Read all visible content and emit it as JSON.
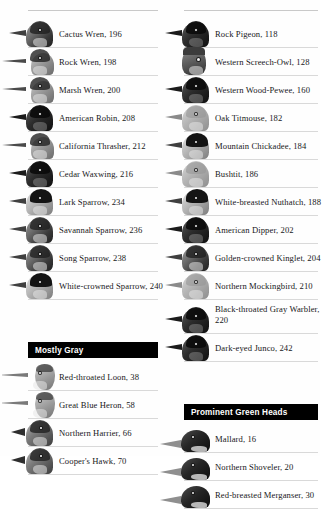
{
  "page": {
    "layout": "two-column-index",
    "background_color": "#fefefe",
    "text_color": "#18181a",
    "rule_color": "#d9d9d9",
    "header_bar_color": "#000000",
    "header_text_color": "#ffffff"
  },
  "left_column": {
    "blocks": [
      {
        "type": "list",
        "entries": [
          {
            "name": "Cactus Wren",
            "page": "196",
            "label": "Cactus Wren, 196",
            "thumb": "bird-head-cactus-wren",
            "variant": "default"
          },
          {
            "name": "Rock Wren",
            "page": "198",
            "label": "Rock Wren, 198",
            "thumb": "bird-head-rock-wren",
            "variant": "longbill"
          },
          {
            "name": "Marsh Wren",
            "page": "200",
            "label": "Marsh Wren, 200",
            "thumb": "bird-head-marsh-wren",
            "variant": "longbill"
          },
          {
            "name": "American Robin",
            "page": "208",
            "label": "American Robin, 208",
            "thumb": "bird-head-american-robin",
            "variant": "dark"
          },
          {
            "name": "California Thrasher",
            "page": "212",
            "label": "California Thrasher, 212",
            "thumb": "bird-head-california-thrasher",
            "variant": "longbill"
          },
          {
            "name": "Cedar Waxwing",
            "page": "216",
            "label": "Cedar Waxwing, 216",
            "thumb": "bird-head-cedar-waxwing",
            "variant": "dark"
          },
          {
            "name": "Lark Sparrow",
            "page": "234",
            "label": "Lark Sparrow, 234",
            "thumb": "bird-head-lark-sparrow",
            "variant": "capped"
          },
          {
            "name": "Savannah Sparrow",
            "page": "236",
            "label": "Savannah Sparrow, 236",
            "thumb": "bird-head-savannah-sparrow",
            "variant": "default"
          },
          {
            "name": "Song Sparrow",
            "page": "238",
            "label": "Song Sparrow, 238",
            "thumb": "bird-head-song-sparrow",
            "variant": "default"
          },
          {
            "name": "White-crowned Sparrow",
            "page": "240",
            "label": "White-crowned Sparrow, 240",
            "thumb": "bird-head-white-crowned-sparrow",
            "variant": "capped"
          }
        ]
      },
      {
        "type": "section",
        "header": "Mostly Gray",
        "entries": [
          {
            "name": "Red-throated Loon",
            "page": "38",
            "label": "Red-throated Loon, 38",
            "thumb": "bird-head-red-throated-loon",
            "variant": "heron"
          },
          {
            "name": "Great Blue Heron",
            "page": "58",
            "label": "Great Blue Heron, 58",
            "thumb": "bird-head-great-blue-heron",
            "variant": "heron"
          },
          {
            "name": "Northern Harrier",
            "page": "66",
            "label": "Northern Harrier, 66",
            "thumb": "bird-head-northern-harrier",
            "variant": "raptor"
          },
          {
            "name": "Cooper's Hawk",
            "page": "70",
            "label": "Cooper's Hawk, 70",
            "thumb": "bird-head-coopers-hawk",
            "variant": "raptor"
          }
        ]
      }
    ]
  },
  "right_column": {
    "blocks": [
      {
        "type": "list",
        "entries": [
          {
            "name": "Rock Pigeon",
            "page": "118",
            "label": "Rock Pigeon, 118",
            "thumb": "bird-head-rock-pigeon",
            "variant": "dark"
          },
          {
            "name": "Western Screech-Owl",
            "page": "128",
            "label": "Western Screech-Owl, 128",
            "thumb": "bird-head-western-screech-owl",
            "variant": "owl"
          },
          {
            "name": "Western Wood-Pewee",
            "page": "160",
            "label": "Western Wood-Pewee, 160",
            "thumb": "bird-head-western-wood-pewee",
            "variant": "dark"
          },
          {
            "name": "Oak Titmouse",
            "page": "182",
            "label": "Oak Titmouse, 182",
            "thumb": "bird-head-oak-titmouse",
            "variant": "pale"
          },
          {
            "name": "Mountain Chickadee",
            "page": "184",
            "label": "Mountain Chickadee, 184",
            "thumb": "bird-head-mountain-chickadee",
            "variant": "capped"
          },
          {
            "name": "Bushtit",
            "page": "186",
            "label": "Bushtit, 186",
            "thumb": "bird-head-bushtit",
            "variant": "pale"
          },
          {
            "name": "White-breasted Nuthatch",
            "page": "188",
            "label": "White-breasted Nuthatch, 188",
            "thumb": "bird-head-white-breasted-nuthatch",
            "variant": "capped"
          },
          {
            "name": "American Dipper",
            "page": "202",
            "label": "American Dipper, 202",
            "thumb": "bird-head-american-dipper",
            "variant": "dark"
          },
          {
            "name": "Golden-crowned Kinglet",
            "page": "204",
            "label": "Golden-crowned Kinglet, 204",
            "thumb": "bird-head-golden-crowned-kinglet",
            "variant": "default"
          },
          {
            "name": "Northern Mockingbird",
            "page": "210",
            "label": "Northern Mockingbird, 210",
            "thumb": "bird-head-northern-mockingbird",
            "variant": "pale"
          },
          {
            "name": "Black-throated Gray Warbler",
            "page": "220",
            "label": "Black-throated Gray Warbler, 220",
            "thumb": "bird-head-black-throated-gray-warbler",
            "variant": "dark",
            "two_line": true
          },
          {
            "name": "Dark-eyed Junco",
            "page": "242",
            "label": "Dark-eyed Junco, 242",
            "thumb": "bird-head-dark-eyed-junco",
            "variant": "dark"
          }
        ]
      },
      {
        "type": "section",
        "header": "Prominent Green Heads",
        "entries": [
          {
            "name": "Mallard",
            "page": "16",
            "label": "Mallard, 16",
            "thumb": "bird-head-mallard",
            "variant": "duck"
          },
          {
            "name": "Northern Shoveler",
            "page": "20",
            "label": "Northern Shoveler, 20",
            "thumb": "bird-head-northern-shoveler",
            "variant": "duck"
          },
          {
            "name": "Red-breasted Merganser",
            "page": "30",
            "label": "Red-breasted Merganser, 30",
            "thumb": "bird-head-red-breasted-merganser",
            "variant": "duck"
          }
        ]
      }
    ]
  }
}
